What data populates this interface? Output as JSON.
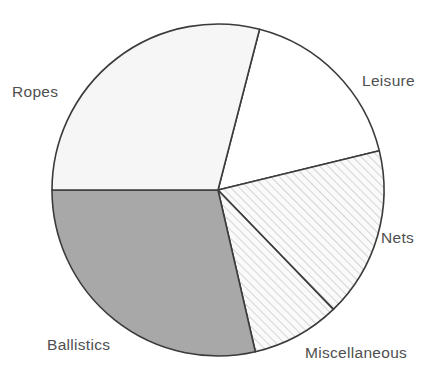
{
  "chart_data": {
    "type": "pie",
    "title": "",
    "subtitle": "",
    "xlabel": "",
    "ylabel": "",
    "legend_position": "none",
    "grid": false,
    "labels_position": "outside",
    "start_angle_deg": 14.5,
    "direction": "clockwise",
    "categories": [
      "Leisure",
      "Nets",
      "Miscellaneous",
      "Ballistics",
      "Ropes"
    ],
    "values": [
      17.2,
      16.6,
      8.6,
      28.6,
      29.0
    ],
    "units": "percent",
    "slices": [
      {
        "label": "Leisure",
        "value": 17.2,
        "start_angle_deg": 14.5,
        "end_angle_deg": 76.3,
        "sweep_deg": 61.8,
        "fill": "#ffffff",
        "pattern": "solid",
        "stroke": "#3b3b3b"
      },
      {
        "label": "Nets",
        "value": 16.6,
        "start_angle_deg": 76.3,
        "end_angle_deg": 136.0,
        "sweep_deg": 59.7,
        "fill": "#f7f7f7",
        "pattern": "diagonal-hatch",
        "stroke": "#3b3b3b"
      },
      {
        "label": "Miscellaneous",
        "value": 8.6,
        "start_angle_deg": 136.0,
        "end_angle_deg": 167.0,
        "sweep_deg": 31.0,
        "fill": "#f7f7f7",
        "pattern": "diagonal-hatch",
        "stroke": "#3b3b3b"
      },
      {
        "label": "Ballistics",
        "value": 28.6,
        "start_angle_deg": 167.0,
        "end_angle_deg": 270.0,
        "sweep_deg": 103.0,
        "fill": "#a8a8a8",
        "pattern": "solid",
        "stroke": "#3b3b3b"
      },
      {
        "label": "Ropes",
        "value": 29.0,
        "start_angle_deg": 270.0,
        "end_angle_deg": 374.5,
        "sweep_deg": 104.5,
        "fill": "#f6f6f6",
        "pattern": "solid",
        "stroke": "#3b3b3b"
      }
    ],
    "geometry": {
      "center_x": 218,
      "center_y": 190,
      "radius": 166
    }
  },
  "labels": {
    "ropes": "Ropes",
    "leisure": "Leisure",
    "nets": "Nets",
    "miscellaneous": "Miscellaneous",
    "ballistics": "Ballistics"
  },
  "colors": {
    "outline": "#3b3b3b",
    "ballistics_fill": "#a8a8a8",
    "ropes_fill": "#f6f6f6",
    "leisure_fill": "#ffffff",
    "hatch_fill": "#f7f7f7",
    "background": "#ffffff",
    "label_text": "#4f4f4f"
  }
}
